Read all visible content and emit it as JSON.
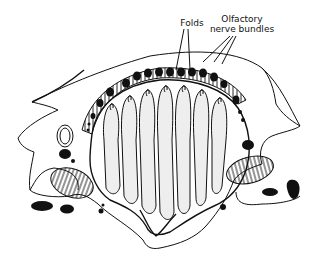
{
  "figure": {
    "type": "anatomical line drawing",
    "labels": {
      "folds": "Folds",
      "olfactory_line1": "Olfactory",
      "olfactory_line2": "nerve bundles"
    }
  }
}
